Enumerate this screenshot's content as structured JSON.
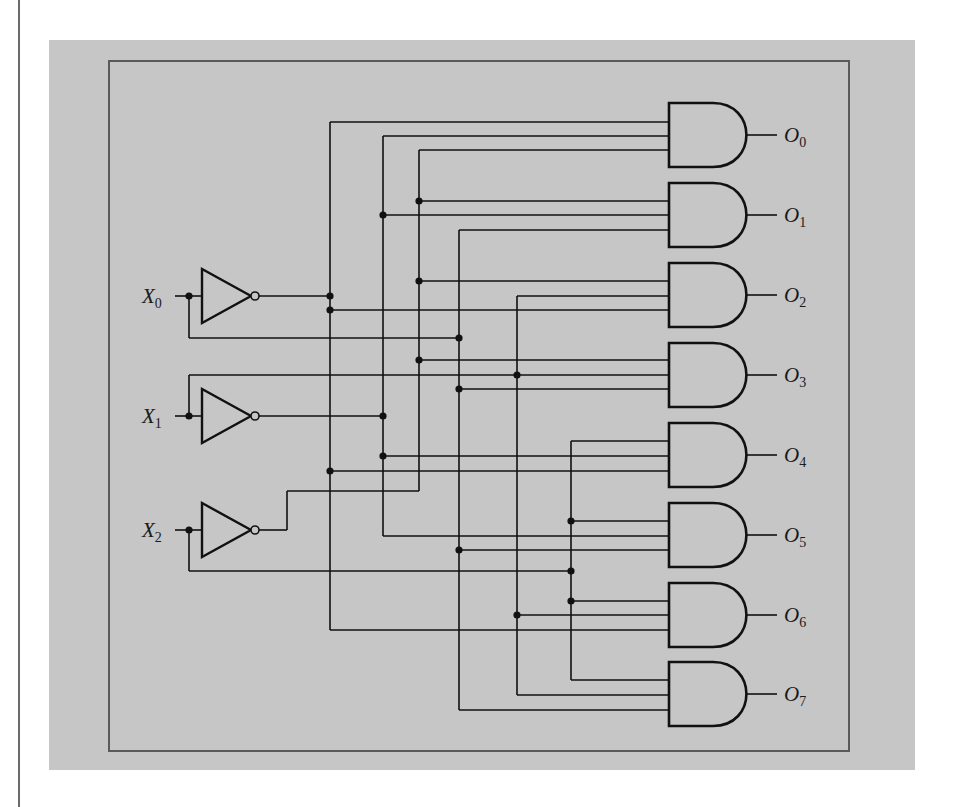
{
  "diagram": {
    "type": "3-to-8 line decoder (logic circuit)",
    "colors": {
      "panel": "#c6c6c6",
      "frame": "#5a5a5a",
      "wire": "#111111",
      "page": "#ffffff"
    },
    "inputs": [
      {
        "id": "X0",
        "letter": "X",
        "sub": "0",
        "y": 296
      },
      {
        "id": "X1",
        "letter": "X",
        "sub": "1",
        "y": 416
      },
      {
        "id": "X2",
        "letter": "X",
        "sub": "2",
        "y": 530
      }
    ],
    "outputs": [
      {
        "id": "O0",
        "letter": "O",
        "sub": "0",
        "cy": 135,
        "inputs": [
          122,
          136,
          150
        ]
      },
      {
        "id": "O1",
        "letter": "O",
        "sub": "1",
        "cy": 215,
        "inputs": [
          201,
          215,
          230
        ]
      },
      {
        "id": "O2",
        "letter": "O",
        "sub": "2",
        "cy": 295,
        "inputs": [
          281,
          296,
          310
        ]
      },
      {
        "id": "O3",
        "letter": "O",
        "sub": "3",
        "cy": 375,
        "inputs": [
          360,
          375,
          389
        ]
      },
      {
        "id": "O4",
        "letter": "O",
        "sub": "4",
        "cy": 455,
        "inputs": [
          441,
          456,
          471
        ]
      },
      {
        "id": "O5",
        "letter": "O",
        "sub": "5",
        "cy": 535,
        "inputs": [
          521,
          536,
          550
        ]
      },
      {
        "id": "O6",
        "letter": "O",
        "sub": "6",
        "cy": 615,
        "inputs": [
          601,
          615,
          630
        ]
      },
      {
        "id": "O7",
        "letter": "O",
        "sub": "7",
        "cy": 694,
        "inputs": [
          680,
          695,
          710
        ]
      }
    ],
    "wires": [
      [
        [
          175,
          296
        ],
        [
          202,
          296
        ]
      ],
      [
        [
          175,
          416
        ],
        [
          202,
          416
        ]
      ],
      [
        [
          175,
          530
        ],
        [
          202,
          530
        ]
      ],
      [
        [
          259,
          296
        ],
        [
          330,
          296
        ]
      ],
      [
        [
          330,
          122
        ],
        [
          330,
          630
        ]
      ],
      [
        [
          330,
          122
        ],
        [
          669,
          122
        ]
      ],
      [
        [
          330,
          310
        ],
        [
          669,
          310
        ]
      ],
      [
        [
          330,
          471
        ],
        [
          669,
          471
        ]
      ],
      [
        [
          330,
          630
        ],
        [
          669,
          630
        ]
      ],
      [
        [
          259,
          416
        ],
        [
          383,
          416
        ]
      ],
      [
        [
          383,
          136
        ],
        [
          383,
          536
        ]
      ],
      [
        [
          383,
          136
        ],
        [
          669,
          136
        ]
      ],
      [
        [
          383,
          215
        ],
        [
          669,
          215
        ]
      ],
      [
        [
          383,
          456
        ],
        [
          669,
          456
        ]
      ],
      [
        [
          383,
          536
        ],
        [
          669,
          536
        ]
      ],
      [
        [
          259,
          530
        ],
        [
          287,
          530
        ]
      ],
      [
        [
          287,
          530
        ],
        [
          287,
          491
        ]
      ],
      [
        [
          287,
          491
        ],
        [
          419,
          491
        ]
      ],
      [
        [
          419,
          150
        ],
        [
          419,
          491
        ]
      ],
      [
        [
          419,
          150
        ],
        [
          669,
          150
        ]
      ],
      [
        [
          419,
          201
        ],
        [
          669,
          201
        ]
      ],
      [
        [
          419,
          281
        ],
        [
          669,
          281
        ]
      ],
      [
        [
          419,
          360
        ],
        [
          669,
          360
        ]
      ],
      [
        [
          189,
          296
        ],
        [
          189,
          338
        ]
      ],
      [
        [
          189,
          338
        ],
        [
          459,
          338
        ]
      ],
      [
        [
          459,
          230
        ],
        [
          459,
          710
        ]
      ],
      [
        [
          459,
          230
        ],
        [
          669,
          230
        ]
      ],
      [
        [
          459,
          389
        ],
        [
          669,
          389
        ]
      ],
      [
        [
          459,
          550
        ],
        [
          669,
          550
        ]
      ],
      [
        [
          459,
          710
        ],
        [
          669,
          710
        ]
      ],
      [
        [
          189,
          416
        ],
        [
          189,
          375
        ]
      ],
      [
        [
          189,
          375
        ],
        [
          669,
          375
        ]
      ],
      [
        [
          517,
          296
        ],
        [
          517,
          695
        ]
      ],
      [
        [
          517,
          296
        ],
        [
          669,
          296
        ]
      ],
      [
        [
          517,
          615
        ],
        [
          669,
          615
        ]
      ],
      [
        [
          517,
          695
        ],
        [
          669,
          695
        ]
      ],
      [
        [
          189,
          530
        ],
        [
          189,
          571
        ]
      ],
      [
        [
          189,
          571
        ],
        [
          571,
          571
        ]
      ],
      [
        [
          571,
          441
        ],
        [
          571,
          680
        ]
      ],
      [
        [
          571,
          441
        ],
        [
          669,
          441
        ]
      ],
      [
        [
          571,
          521
        ],
        [
          669,
          521
        ]
      ],
      [
        [
          571,
          601
        ],
        [
          669,
          601
        ]
      ],
      [
        [
          571,
          680
        ],
        [
          669,
          680
        ]
      ]
    ],
    "junctions": [
      [
        189,
        296
      ],
      [
        189,
        416
      ],
      [
        189,
        530
      ],
      [
        330,
        296
      ],
      [
        330,
        310
      ],
      [
        330,
        471
      ],
      [
        383,
        215
      ],
      [
        383,
        416
      ],
      [
        383,
        456
      ],
      [
        419,
        201
      ],
      [
        419,
        281
      ],
      [
        419,
        360
      ],
      [
        459,
        338
      ],
      [
        459,
        389
      ],
      [
        459,
        550
      ],
      [
        517,
        375
      ],
      [
        517,
        615
      ],
      [
        571,
        521
      ],
      [
        571,
        571
      ],
      [
        571,
        601
      ]
    ],
    "inverters": [
      {
        "input": "X0",
        "y": 296
      },
      {
        "input": "X1",
        "y": 416
      },
      {
        "input": "X2",
        "y": 530
      }
    ],
    "gate_geometry": {
      "left_x": 669,
      "flat_to_x": 713,
      "right_x": 746,
      "half_height": 32,
      "out_end_x": 777,
      "label_x": 784
    }
  }
}
